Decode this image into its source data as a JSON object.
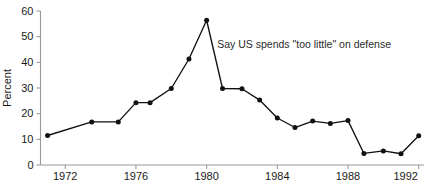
{
  "chart_data": {
    "type": "line",
    "title": "",
    "xlabel": "",
    "ylabel": "Percent",
    "ylim": [
      0,
      60
    ],
    "xlim": [
      1970.6,
      1992.3
    ],
    "grid": false,
    "legend": null,
    "y_ticks": [
      0,
      10,
      20,
      30,
      40,
      50,
      60
    ],
    "y_tick_labels": [
      "0",
      "10",
      "20",
      "30",
      "40",
      "50",
      "60"
    ],
    "x_ticks": [
      1972,
      1976,
      1980,
      1984,
      1988,
      1992
    ],
    "x_tick_labels": [
      "1972",
      "1976",
      "1980",
      "1984",
      "1988",
      "1992"
    ],
    "x_tick_label_clipped_last": "199",
    "annotations": [
      {
        "text": "Say US spends \"too little\" on defense",
        "x": 1980.6,
        "y": 45.5
      }
    ],
    "series": [
      {
        "name": "Say US spends \"too little\" on defense",
        "marker": "circle",
        "color": "#111111",
        "x": [
          1971,
          1973.5,
          1975,
          1976,
          1976.8,
          1978,
          1979,
          1980,
          1980.9,
          1982,
          1983,
          1984,
          1985,
          1986,
          1987,
          1988,
          1988.9,
          1990,
          1991,
          1992
        ],
        "values": [
          11.5,
          16.8,
          16.8,
          24.3,
          24.3,
          29.8,
          41.3,
          56.4,
          29.8,
          29.7,
          25.3,
          18.3,
          14.6,
          17.1,
          16.2,
          17.3,
          4.5,
          5.5,
          4.4,
          11.4
        ]
      }
    ]
  },
  "axes": {
    "y_axis_title": "Percent"
  }
}
